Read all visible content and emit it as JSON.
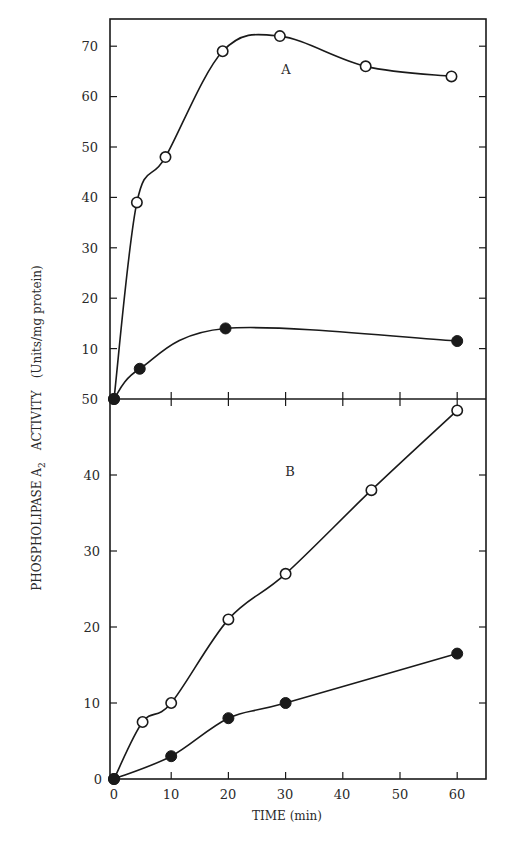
{
  "chart_data": [
    {
      "type": "line",
      "panel": "A",
      "panel_label": "A",
      "x": [
        0,
        5,
        10,
        20,
        30,
        45,
        60
      ],
      "series": [
        {
          "name": "open circles",
          "marker": "open-circle",
          "x": [
            0,
            4,
            9,
            19,
            29,
            44,
            59
          ],
          "values": [
            0,
            39,
            48,
            69,
            72,
            66,
            64
          ]
        },
        {
          "name": "filled circles",
          "marker": "filled-circle",
          "x": [
            0,
            4.5,
            19.5,
            60
          ],
          "values": [
            0,
            6,
            14,
            11.5
          ]
        }
      ],
      "yticks": [
        10,
        20,
        30,
        40,
        50,
        60,
        70
      ],
      "ylim": [
        0,
        75
      ],
      "xlim": [
        0,
        65
      ],
      "grid": false
    },
    {
      "type": "line",
      "panel": "B",
      "panel_label": "B",
      "series": [
        {
          "name": "open circles",
          "marker": "open-circle",
          "x": [
            0,
            5,
            10,
            20,
            30,
            45,
            60
          ],
          "values": [
            0,
            7.5,
            10,
            21,
            27,
            38,
            48.5
          ]
        },
        {
          "name": "filled circles",
          "marker": "filled-circle",
          "x": [
            0,
            10,
            20,
            30,
            60
          ],
          "values": [
            0,
            3,
            8,
            10,
            16.5
          ]
        }
      ],
      "yticks": [
        0,
        10,
        20,
        30,
        40,
        50
      ],
      "xticks": [
        0,
        10,
        20,
        30,
        40,
        50,
        60
      ],
      "ylim": [
        0,
        50
      ],
      "xlim": [
        0,
        65
      ],
      "grid": false
    }
  ],
  "labels": {
    "ylabel": "PHOSPHOLIPASE A₂  ACTIVITY   (Units/mg protein)",
    "ylabel_main": "PHOSPHOLIPASE A",
    "ylabel_sub": "2",
    "ylabel_activity": "ACTIVITY",
    "ylabel_units": "(Units/mg protein)",
    "xlabel": "TIME (min)",
    "panel_a": "A",
    "panel_b": "B"
  },
  "ticks": {
    "a_y": [
      "70",
      "60",
      "50",
      "40",
      "30",
      "20",
      "10"
    ],
    "shared_y": "50",
    "b_y": [
      "40",
      "30",
      "20",
      "10",
      "0"
    ],
    "x": [
      "0",
      "10",
      "20",
      "30",
      "40",
      "50",
      "60"
    ]
  },
  "colors": {
    "ink": "#1a1a1a",
    "background": "#ffffff"
  }
}
